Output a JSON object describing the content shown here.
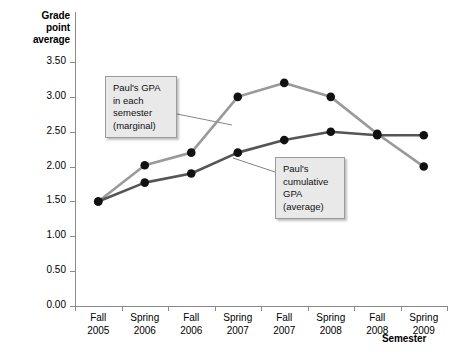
{
  "chart_data": {
    "type": "line",
    "title": "",
    "xlabel": "Semester",
    "ylabel": "Grade point average",
    "ylim": [
      0.0,
      3.5
    ],
    "ytick_labels": [
      "0.00",
      "0.50",
      "1.00",
      "1.50",
      "2.00",
      "2.50",
      "3.00",
      "3.50"
    ],
    "ytick_values": [
      0.0,
      0.5,
      1.0,
      1.5,
      2.0,
      2.5,
      3.0,
      3.5
    ],
    "grid": false,
    "legend_position": "annotations",
    "categories": [
      "Fall 2005",
      "Spring 2006",
      "Fall 2006",
      "Spring 2007",
      "Fall 2007",
      "Spring 2008",
      "Fall 2008",
      "Spring 2009"
    ],
    "category_lines": [
      [
        "Fall",
        "2005"
      ],
      [
        "Spring",
        "2006"
      ],
      [
        "Fall",
        "2006"
      ],
      [
        "Spring",
        "2007"
      ],
      [
        "Fall",
        "2007"
      ],
      [
        "Spring",
        "2008"
      ],
      [
        "Fall",
        "2008"
      ],
      [
        "Spring",
        "2009"
      ]
    ],
    "series": [
      {
        "name": "Paul's GPA in each semester (marginal)",
        "color": "#9a9a9a",
        "marker_color": "#111111",
        "values": [
          1.5,
          2.02,
          2.2,
          3.0,
          3.2,
          3.0,
          2.47,
          2.0
        ]
      },
      {
        "name": "Paul's cumulative GPA (average)",
        "color": "#555555",
        "marker_color": "#111111",
        "values": [
          1.5,
          1.77,
          1.9,
          2.2,
          2.38,
          2.5,
          2.45,
          2.45
        ]
      }
    ],
    "annotations": [
      {
        "id": "marginal",
        "lines": [
          "Paul's GPA",
          "in each",
          "semester",
          "(marginal)"
        ]
      },
      {
        "id": "cumulative",
        "lines": [
          "Paul's",
          "cumulative",
          "GPA",
          "(average)"
        ]
      }
    ]
  },
  "axes": {
    "y_title_lines": [
      "Grade",
      "point",
      "average"
    ],
    "x_title": "Semester"
  },
  "colors": {
    "axis": "#8a8a8a",
    "marginal_line": "#9a9a9a",
    "cumulative_line": "#555555",
    "marker": "#111111",
    "callout_bg": "#e9e9e9",
    "callout_border": "#9b9b9b",
    "background": "#ffffff"
  }
}
